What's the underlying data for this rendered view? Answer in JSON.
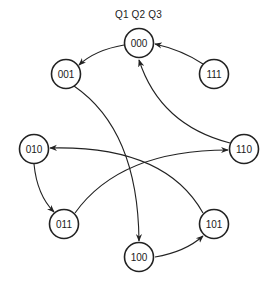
{
  "diagram": {
    "type": "state-transition",
    "header_label": "Q1 Q2 Q3",
    "stroke_color": "#222222",
    "background": "#ffffff",
    "states": [
      {
        "id": "000",
        "label": "000",
        "cx": 139,
        "cy": 43
      },
      {
        "id": "001",
        "label": "001",
        "cx": 66,
        "cy": 74
      },
      {
        "id": "111",
        "label": "111",
        "cx": 214,
        "cy": 74
      },
      {
        "id": "010",
        "label": "010",
        "cx": 34,
        "cy": 149
      },
      {
        "id": "110",
        "label": "110",
        "cx": 244,
        "cy": 149
      },
      {
        "id": "011",
        "label": "011",
        "cx": 64,
        "cy": 224
      },
      {
        "id": "101",
        "label": "101",
        "cx": 214,
        "cy": 224
      },
      {
        "id": "100",
        "label": "100",
        "cx": 139,
        "cy": 257
      }
    ],
    "transitions": [
      {
        "from": "000",
        "to": "001"
      },
      {
        "from": "111",
        "to": "000"
      },
      {
        "from": "001",
        "to": "100"
      },
      {
        "from": "110",
        "to": "000"
      },
      {
        "from": "010",
        "to": "011"
      },
      {
        "from": "011",
        "to": "110"
      },
      {
        "from": "101",
        "to": "010"
      },
      {
        "from": "100",
        "to": "101"
      }
    ]
  }
}
